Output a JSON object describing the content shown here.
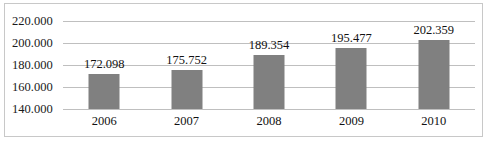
{
  "chart_data": {
    "type": "bar",
    "title": "",
    "subtitle": "",
    "xlabel": "",
    "ylabel": "",
    "categories": [
      "2006",
      "2007",
      "2008",
      "2009",
      "2010"
    ],
    "values": [
      172098,
      175752,
      189354,
      195477,
      202359
    ],
    "value_labels": [
      "172.098",
      "175.752",
      "189.354",
      "195.477",
      "202.359"
    ],
    "ylim": [
      140000,
      220000
    ],
    "ytick_values": [
      140000,
      160000,
      180000,
      200000,
      220000
    ],
    "ytick_labels": [
      "140.000",
      "160.000",
      "180.000",
      "200.000",
      "220.000"
    ],
    "number_format": "european-dot-thousands",
    "grid": true,
    "grid_axis": "y",
    "legend": false,
    "legend_position": "none",
    "series": [
      {
        "name": "",
        "values": [
          172098,
          175752,
          189354,
          195477,
          202359
        ],
        "color": "#808080"
      }
    ],
    "colors": {
      "bar": "#808080",
      "gridline": "#bfbfbf",
      "border": "#c8c8c8",
      "text": "#111111",
      "background": "#ffffff"
    }
  }
}
